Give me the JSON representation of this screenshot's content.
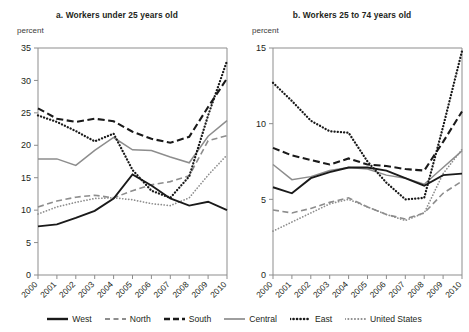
{
  "figure": {
    "axis_unit_label": "percent",
    "colors": {
      "dark": "#1a1a1a",
      "gray": "#8d8d8d",
      "axis": "#8d8d8d",
      "text": "#231f20"
    }
  },
  "legend": {
    "items": [
      {
        "label": "West",
        "style": "solid",
        "color": "#1a1a1a",
        "icon": "line-solid-dark-icon"
      },
      {
        "label": "North",
        "style": "dashed",
        "color": "#8d8d8d",
        "icon": "line-dashed-gray-icon"
      },
      {
        "label": "South",
        "style": "dashed",
        "color": "#1a1a1a",
        "icon": "line-dashed-dark-icon"
      },
      {
        "label": "Central",
        "style": "solid",
        "color": "#8d8d8d",
        "icon": "line-solid-gray-icon"
      },
      {
        "label": "East",
        "style": "dotted",
        "color": "#1a1a1a",
        "icon": "line-dotted-dark-icon"
      },
      {
        "label": "United States",
        "style": "dotted",
        "color": "#8d8d8d",
        "icon": "line-dotted-gray-icon"
      }
    ]
  },
  "chart_data": [
    {
      "type": "line",
      "panel": "a",
      "title": "a.  Workers under 25 years old",
      "xlabel": "",
      "ylabel": "percent",
      "grid": false,
      "legend_position": "bottom-shared",
      "x": [
        2000,
        2001,
        2002,
        2003,
        2004,
        2005,
        2006,
        2007,
        2008,
        2009,
        2010
      ],
      "xtick_labels": [
        "2000",
        "2001",
        "2002",
        "2003",
        "2004",
        "2005",
        "2006",
        "2007",
        "2008",
        "2009",
        "2010"
      ],
      "ytick_labels": [
        "0",
        "5",
        "10",
        "15",
        "20",
        "25",
        "30",
        "35"
      ],
      "ylim": [
        0,
        35
      ],
      "ytick_step": 5,
      "series": [
        {
          "name": "West",
          "style": "solid",
          "color": "#1a1a1a",
          "values": [
            7.5,
            7.8,
            8.8,
            9.9,
            11.8,
            15.5,
            13.8,
            11.8,
            10.7,
            11.3,
            10.0
          ]
        },
        {
          "name": "North",
          "style": "dashed",
          "color": "#8d8d8d",
          "values": [
            10.5,
            11.4,
            12.0,
            12.3,
            11.9,
            13.0,
            13.9,
            14.4,
            15.3,
            20.7,
            21.5
          ]
        },
        {
          "name": "South",
          "style": "dashed",
          "color": "#1a1a1a",
          "values": [
            25.7,
            24.1,
            23.6,
            24.1,
            23.7,
            22.1,
            21.0,
            20.4,
            21.3,
            25.9,
            30.3
          ]
        },
        {
          "name": "Central",
          "style": "solid",
          "color": "#8d8d8d",
          "values": [
            17.9,
            17.9,
            16.9,
            19.2,
            21.2,
            19.3,
            19.2,
            18.2,
            17.3,
            21.4,
            23.8
          ]
        },
        {
          "name": "East",
          "style": "dotted",
          "color": "#1a1a1a",
          "values": [
            24.6,
            23.6,
            22.2,
            20.6,
            21.8,
            16.2,
            13.0,
            11.9,
            15.2,
            24.6,
            33.0
          ]
        },
        {
          "name": "United States",
          "style": "dotted",
          "color": "#8d8d8d",
          "values": [
            9.4,
            10.5,
            11.2,
            11.8,
            11.9,
            11.6,
            11.0,
            10.7,
            11.9,
            15.4,
            18.5
          ]
        }
      ]
    },
    {
      "type": "line",
      "panel": "b",
      "title": "b.  Workers 25 to 74 years old",
      "xlabel": "",
      "ylabel": "percent",
      "grid": false,
      "legend_position": "bottom-shared",
      "x": [
        2000,
        2001,
        2002,
        2003,
        2004,
        2005,
        2006,
        2007,
        2008,
        2009,
        2010
      ],
      "xtick_labels": [
        "2000",
        "2001",
        "2002",
        "2003",
        "2004",
        "2005",
        "2006",
        "2007",
        "2008",
        "2009",
        "2010"
      ],
      "ytick_labels": [
        "0",
        "5",
        "10",
        "15"
      ],
      "ylim": [
        0,
        15
      ],
      "ytick_step": 5,
      "series": [
        {
          "name": "West",
          "style": "solid",
          "color": "#1a1a1a",
          "values": [
            5.8,
            5.4,
            6.4,
            6.8,
            7.1,
            7.1,
            6.9,
            6.4,
            5.9,
            6.6,
            6.7
          ]
        },
        {
          "name": "North",
          "style": "dashed",
          "color": "#8d8d8d",
          "values": [
            4.3,
            4.1,
            4.4,
            4.8,
            5.1,
            4.5,
            4.0,
            3.7,
            4.1,
            5.4,
            6.2
          ]
        },
        {
          "name": "South",
          "style": "dashed",
          "color": "#1a1a1a",
          "values": [
            8.4,
            7.9,
            7.6,
            7.3,
            7.7,
            7.3,
            7.2,
            7.0,
            6.9,
            8.8,
            10.8
          ]
        },
        {
          "name": "Central",
          "style": "solid",
          "color": "#8d8d8d",
          "values": [
            7.3,
            6.3,
            6.5,
            6.9,
            7.1,
            7.0,
            6.6,
            6.4,
            6.0,
            7.1,
            8.2
          ]
        },
        {
          "name": "East",
          "style": "dotted",
          "color": "#1a1a1a",
          "values": [
            12.7,
            11.5,
            10.2,
            9.5,
            9.4,
            7.5,
            6.1,
            5.0,
            5.1,
            9.8,
            14.8
          ]
        },
        {
          "name": "United States",
          "style": "dotted",
          "color": "#8d8d8d",
          "values": [
            2.9,
            3.5,
            4.1,
            4.7,
            5.0,
            4.5,
            4.0,
            3.6,
            4.1,
            6.7,
            8.3
          ]
        }
      ]
    }
  ]
}
